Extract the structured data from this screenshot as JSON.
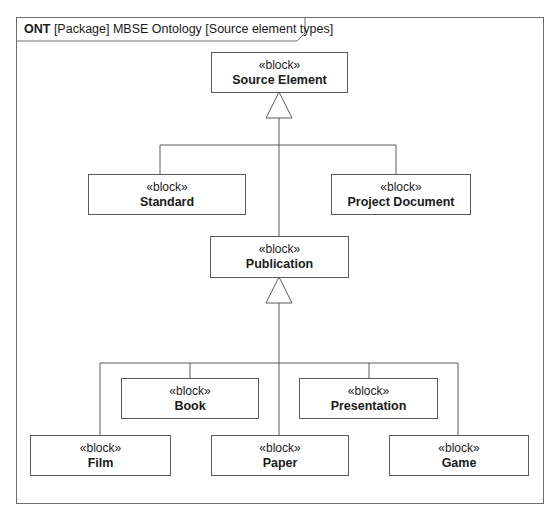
{
  "frame": {
    "kind": "ONT",
    "title": "[Package] MBSE Ontology [Source element types]"
  },
  "blocks": {
    "source_element": {
      "stereotype": "«block»",
      "name": "Source Element"
    },
    "standard": {
      "stereotype": "«block»",
      "name": "Standard"
    },
    "project_document": {
      "stereotype": "«block»",
      "name": "Project Document"
    },
    "publication": {
      "stereotype": "«block»",
      "name": "Publication"
    },
    "book": {
      "stereotype": "«block»",
      "name": "Book"
    },
    "presentation": {
      "stereotype": "«block»",
      "name": "Presentation"
    },
    "film": {
      "stereotype": "«block»",
      "name": "Film"
    },
    "paper": {
      "stereotype": "«block»",
      "name": "Paper"
    },
    "game": {
      "stereotype": "«block»",
      "name": "Game"
    }
  },
  "relationships": [
    {
      "type": "generalization",
      "parent": "Source Element",
      "children": [
        "Standard",
        "Project Document",
        "Publication"
      ]
    },
    {
      "type": "generalization",
      "parent": "Publication",
      "children": [
        "Book",
        "Presentation",
        "Film",
        "Paper",
        "Game"
      ]
    }
  ],
  "colors": {
    "line": "#5a5a5a",
    "frame": "#6e6e6e",
    "background": "#ffffff"
  }
}
